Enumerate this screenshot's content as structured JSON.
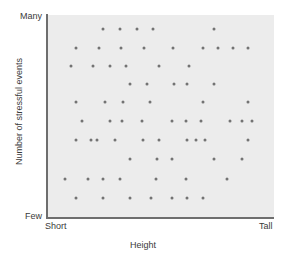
{
  "chart_data": {
    "type": "scatter",
    "title": "",
    "subtitle": "",
    "xlabel": "Height",
    "ylabel": "Number of stressful events",
    "xticklabels": [
      "Short",
      "Tall"
    ],
    "yticklabels": [
      "Many",
      "Few"
    ],
    "xlim": [
      0,
      100
    ],
    "ylim": [
      0,
      100
    ],
    "grid": false,
    "legend": null,
    "annotations": [],
    "marker": {
      "shape": "circle",
      "size_px": 3,
      "color": "#737373"
    },
    "panel_color": "#ececec",
    "axis_color": "#6e6e6e",
    "points": [
      {
        "x": 24.3,
        "y": 93.1
      },
      {
        "x": 31.9,
        "y": 93.1
      },
      {
        "x": 39.4,
        "y": 93.1
      },
      {
        "x": 46.5,
        "y": 93.1
      },
      {
        "x": 73.5,
        "y": 93.1
      },
      {
        "x": 12.4,
        "y": 83.7
      },
      {
        "x": 22.6,
        "y": 83.7
      },
      {
        "x": 32.3,
        "y": 83.7
      },
      {
        "x": 42.5,
        "y": 83.7
      },
      {
        "x": 55.3,
        "y": 83.7
      },
      {
        "x": 68.6,
        "y": 83.7
      },
      {
        "x": 75.2,
        "y": 83.7
      },
      {
        "x": 81.9,
        "y": 83.7
      },
      {
        "x": 88.5,
        "y": 83.7
      },
      {
        "x": 10.2,
        "y": 74.9
      },
      {
        "x": 19.9,
        "y": 74.9
      },
      {
        "x": 27.4,
        "y": 74.9
      },
      {
        "x": 34.5,
        "y": 74.9
      },
      {
        "x": 49.1,
        "y": 74.9
      },
      {
        "x": 62.4,
        "y": 74.9
      },
      {
        "x": 36.3,
        "y": 66.0
      },
      {
        "x": 43.8,
        "y": 66.0
      },
      {
        "x": 55.8,
        "y": 66.0
      },
      {
        "x": 61.5,
        "y": 66.0
      },
      {
        "x": 73.5,
        "y": 66.0
      },
      {
        "x": 12.4,
        "y": 57.1
      },
      {
        "x": 25.2,
        "y": 57.1
      },
      {
        "x": 33.2,
        "y": 57.1
      },
      {
        "x": 45.1,
        "y": 57.1
      },
      {
        "x": 68.6,
        "y": 57.1
      },
      {
        "x": 88.5,
        "y": 57.1
      },
      {
        "x": 15.0,
        "y": 47.8
      },
      {
        "x": 27.4,
        "y": 47.8
      },
      {
        "x": 32.7,
        "y": 47.8
      },
      {
        "x": 41.6,
        "y": 47.8
      },
      {
        "x": 54.9,
        "y": 47.8
      },
      {
        "x": 61.1,
        "y": 47.8
      },
      {
        "x": 67.7,
        "y": 47.8
      },
      {
        "x": 80.5,
        "y": 47.8
      },
      {
        "x": 85.8,
        "y": 47.8
      },
      {
        "x": 90.3,
        "y": 47.8
      },
      {
        "x": 12.4,
        "y": 38.4
      },
      {
        "x": 19.0,
        "y": 38.4
      },
      {
        "x": 21.7,
        "y": 38.4
      },
      {
        "x": 29.6,
        "y": 38.4
      },
      {
        "x": 42.0,
        "y": 38.4
      },
      {
        "x": 49.1,
        "y": 38.4
      },
      {
        "x": 61.5,
        "y": 38.4
      },
      {
        "x": 65.5,
        "y": 38.4
      },
      {
        "x": 69.5,
        "y": 38.4
      },
      {
        "x": 88.5,
        "y": 38.4
      },
      {
        "x": 36.3,
        "y": 29.1
      },
      {
        "x": 48.2,
        "y": 29.1
      },
      {
        "x": 54.9,
        "y": 29.1
      },
      {
        "x": 73.5,
        "y": 29.1
      },
      {
        "x": 85.8,
        "y": 29.1
      },
      {
        "x": 7.5,
        "y": 19.2
      },
      {
        "x": 17.7,
        "y": 19.2
      },
      {
        "x": 24.3,
        "y": 19.2
      },
      {
        "x": 31.9,
        "y": 19.2
      },
      {
        "x": 47.8,
        "y": 19.2
      },
      {
        "x": 61.1,
        "y": 19.2
      },
      {
        "x": 79.2,
        "y": 19.2
      },
      {
        "x": 12.4,
        "y": 9.9
      },
      {
        "x": 24.3,
        "y": 9.9
      },
      {
        "x": 36.3,
        "y": 9.9
      },
      {
        "x": 45.6,
        "y": 9.9
      },
      {
        "x": 54.9,
        "y": 9.9
      },
      {
        "x": 61.5,
        "y": 9.9
      },
      {
        "x": 68.6,
        "y": 9.9
      }
    ]
  }
}
